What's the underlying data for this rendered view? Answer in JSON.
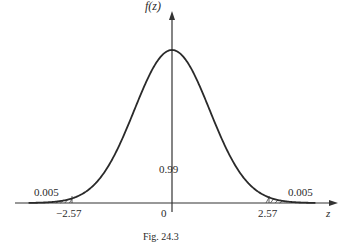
{
  "chart_data": {
    "type": "line",
    "title": "",
    "caption": "Fig. 24.3",
    "xlabel": "z",
    "ylabel": "f(z)",
    "series": [
      {
        "name": "standard normal density",
        "distribution": "normal",
        "mean": 0,
        "sd": 1
      }
    ],
    "x_ticks": [
      "-2.57",
      "0",
      "2.57"
    ],
    "annotations": [
      {
        "text": "0.005",
        "position": "left tail",
        "region": "z < -2.57"
      },
      {
        "text": "0.99",
        "position": "center",
        "region": "-2.57 < z < 2.57"
      },
      {
        "text": "0.005",
        "position": "right tail",
        "region": "z > 2.57"
      }
    ],
    "xlim": [
      -3.8,
      3.8
    ],
    "grid": false,
    "legend": "none"
  },
  "labels": {
    "y_axis": "f(z)",
    "x_axis": "z",
    "tick_left": "−2.57",
    "tick_zero": "0",
    "tick_right": "2.57",
    "area_left": "0.005",
    "area_center": "0.99",
    "area_right": "0.005",
    "caption": "Fig. 24.3"
  }
}
